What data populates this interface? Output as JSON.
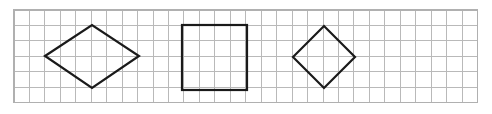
{
  "figure": {
    "background_color": "#ffffff",
    "width": 492,
    "height": 114
  },
  "grid": {
    "name": "square-grid",
    "columns": 30,
    "rows": 6,
    "cell_size": 15.45,
    "origin_x": 14,
    "origin_y": 10,
    "width": 463.5,
    "height": 92.7,
    "line_color": "#b9b9b9",
    "line_width": 1,
    "border_color": "#b0b0b0",
    "border_width": 1.2
  },
  "shapes": [
    {
      "name": "rhombus",
      "label": "Rhombus",
      "type": "polygon",
      "stroke_color": "#1a1a1a",
      "stroke_width": 2.2,
      "fill": "none",
      "points": "45,56 92,25 139,56 92,88",
      "vertices": [
        {
          "x": 45,
          "y": 56
        },
        {
          "x": 92,
          "y": 25
        },
        {
          "x": 139,
          "y": 56
        },
        {
          "x": 92,
          "y": 88
        }
      ],
      "diagonal_horizontal": 94,
      "diagonal_vertical": 63
    },
    {
      "name": "square",
      "label": "Square",
      "type": "rect",
      "stroke_color": "#1a1a1a",
      "stroke_width": 2.2,
      "fill": "none",
      "x": 182,
      "y": 25,
      "width": 65,
      "height": 65
    },
    {
      "name": "rotated-square",
      "label": "Rotated square",
      "type": "polygon",
      "stroke_color": "#1a1a1a",
      "stroke_width": 2.2,
      "fill": "none",
      "points": "293,57 324,26 355,57 324,88",
      "vertices": [
        {
          "x": 293,
          "y": 57
        },
        {
          "x": 324,
          "y": 26
        },
        {
          "x": 355,
          "y": 57
        },
        {
          "x": 324,
          "y": 88
        }
      ],
      "diagonal_horizontal": 62,
      "diagonal_vertical": 62
    }
  ]
}
